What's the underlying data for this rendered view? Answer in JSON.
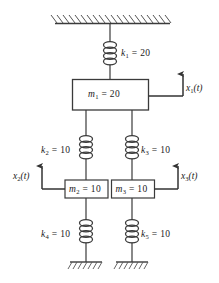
{
  "figure": {
    "type": "mechanical-vibration-schematic",
    "line_color": "#3a3a3a",
    "text_color": "#1a1a1a",
    "background": "#ffffff"
  },
  "supports": {
    "ceiling": {
      "name": "fixed-ceiling-support",
      "hatch_style": "diagonal"
    },
    "ground_left": {
      "name": "fixed-ground-support-left",
      "hatch_style": "diagonal"
    },
    "ground_right": {
      "name": "fixed-ground-support-right",
      "hatch_style": "diagonal"
    }
  },
  "masses": [
    {
      "id": "m1",
      "symbol": "m",
      "subscript": "1",
      "equals": "=",
      "value": "20",
      "label": "m1 = 20"
    },
    {
      "id": "m2",
      "symbol": "m",
      "subscript": "2",
      "equals": "=",
      "value": "10",
      "label": "m2 = 10"
    },
    {
      "id": "m3",
      "symbol": "m",
      "subscript": "3",
      "equals": "=",
      "value": "10",
      "label": "m3 = 10"
    }
  ],
  "springs": [
    {
      "id": "k1",
      "symbol": "k",
      "subscript": "1",
      "equals": "=",
      "value": "20",
      "label": "k1 = 20"
    },
    {
      "id": "k2",
      "symbol": "k",
      "subscript": "2",
      "equals": "=",
      "value": "10",
      "label": "k2 = 10"
    },
    {
      "id": "k3",
      "symbol": "k",
      "subscript": "3",
      "equals": "=",
      "value": "10",
      "label": "k3 = 10"
    },
    {
      "id": "k4",
      "symbol": "k",
      "subscript": "4",
      "equals": "=",
      "value": "10",
      "label": "k4 = 10"
    },
    {
      "id": "k5",
      "symbol": "k",
      "subscript": "5",
      "equals": "=",
      "value": "10",
      "label": "k5 = 10"
    }
  ],
  "coordinates": [
    {
      "id": "x1",
      "symbol": "x",
      "subscript": "1",
      "arg": "(t)",
      "label": "x1(t)",
      "direction": "up"
    },
    {
      "id": "x2",
      "symbol": "x",
      "subscript": "2",
      "arg": "(t)",
      "label": "x2(t)",
      "direction": "up"
    },
    {
      "id": "x3",
      "symbol": "x",
      "subscript": "3",
      "arg": "(t)",
      "label": "x3(t)",
      "direction": "up"
    }
  ]
}
